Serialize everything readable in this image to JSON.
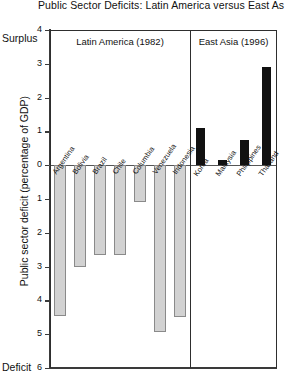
{
  "chart_data": {
    "type": "bar",
    "title": "Public Sector Deficits: Latin America versus East As",
    "xlabel": "",
    "ylabel": "Public sector deficit (percentage of GDP)",
    "top_axis_note": "Surplus",
    "bottom_axis_note": "Deficit",
    "ylim": [
      -6,
      4
    ],
    "y_inverted": true,
    "grid": false,
    "legend": "none",
    "ytick_labels": [
      "4",
      "3",
      "2",
      "1",
      "0",
      "1",
      "2",
      "3",
      "4",
      "5",
      "6"
    ],
    "ytick_values": [
      4,
      3,
      2,
      1,
      0,
      -1,
      -2,
      -3,
      -4,
      -5,
      -6
    ],
    "panels": [
      {
        "name": "Latin America (1982)",
        "categories": [
          "Argentina",
          "Bolivia",
          "Brazil",
          "Chile",
          "Columbia",
          "Venezuela",
          "Indonesia"
        ],
        "values": [
          -4.45,
          -3.0,
          -2.65,
          -2.65,
          -1.1,
          -4.95,
          -4.5
        ]
      },
      {
        "name": "East Asia (1996)",
        "categories": [
          "Korea",
          "Malaysia",
          "Philippines",
          "Thailand"
        ],
        "values": [
          1.1,
          0.15,
          0.75,
          2.9
        ]
      }
    ],
    "colors": {
      "latin_america_bar": "#d2d2d2",
      "latin_america_bar_border": "#8a8a8a",
      "east_asia_bar": "#111111",
      "axis": "#3a3a3a",
      "frame": "#2e2e2e"
    }
  }
}
